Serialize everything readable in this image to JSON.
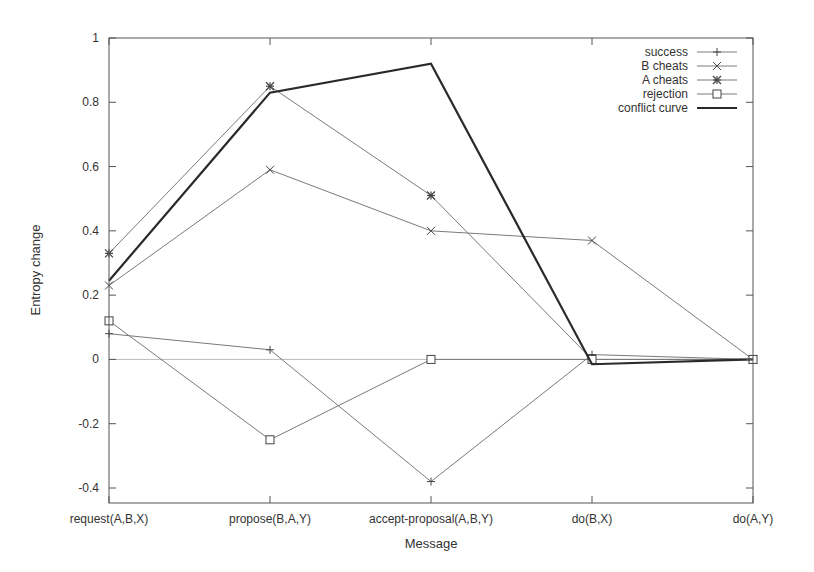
{
  "chart_data": {
    "type": "line",
    "title": "",
    "xlabel": "Message",
    "ylabel": "Entropy change",
    "categories": [
      "request(A,B,X)",
      "propose(B,A,Y)",
      "accept-proposal(A,B,Y)",
      "do(B,X)",
      "do(A,Y)"
    ],
    "ylim": [
      -0.45,
      1.0
    ],
    "yticks": [
      -0.4,
      -0.2,
      0,
      0.2,
      0.4,
      0.6,
      0.8,
      1
    ],
    "ytick_labels": [
      "-0.4",
      "-0.2",
      "0",
      "0.2",
      "0.4",
      "0.6",
      "0.8",
      "1"
    ],
    "grid": false,
    "zero_line": true,
    "legend_position": "top-right-inside",
    "series": [
      {
        "name": "success",
        "marker": "plus",
        "line": "thin",
        "values": [
          0.08,
          0.03,
          -0.38,
          0.015,
          0.0
        ]
      },
      {
        "name": "B cheats",
        "marker": "x",
        "line": "thin",
        "values": [
          0.23,
          0.59,
          0.4,
          0.37,
          0.0
        ]
      },
      {
        "name": "A cheats",
        "marker": "star",
        "line": "thin",
        "values": [
          0.33,
          0.85,
          0.51,
          0.0,
          0.0
        ]
      },
      {
        "name": "rejection",
        "marker": "square",
        "line": "thin",
        "values": [
          0.12,
          -0.25,
          0.0,
          0.0,
          0.0
        ]
      },
      {
        "name": "conflict curve",
        "marker": "none",
        "line": "thick",
        "values": [
          0.245,
          0.83,
          0.92,
          -0.015,
          0.0
        ]
      }
    ]
  },
  "colors": {
    "thin_line": "#7a7a7a",
    "thick_line": "#2a2a2a",
    "frame": "#555555",
    "zero_line": "#bbbbbb",
    "text": "#333333"
  }
}
